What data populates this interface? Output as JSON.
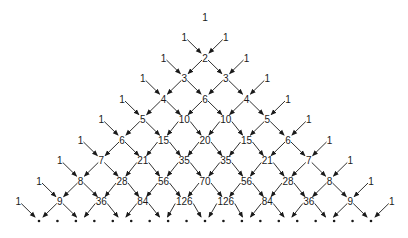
{
  "rows": [
    [
      "1"
    ],
    [
      "1",
      "1"
    ],
    [
      "1",
      "2",
      "1"
    ],
    [
      "1",
      "3",
      "3",
      "1"
    ],
    [
      "1",
      "4",
      "6",
      "4",
      "1"
    ],
    [
      "1",
      "5",
      "10",
      "10",
      "5",
      "1"
    ],
    [
      "1",
      "6",
      "15",
      "20",
      "15",
      "6",
      "1"
    ],
    [
      "1",
      "7",
      "21",
      "35",
      "35",
      "21",
      "7",
      "1"
    ],
    [
      "1",
      "8",
      "28",
      "56",
      "70",
      "56",
      "28",
      "8",
      "1"
    ],
    [
      "1",
      "9",
      "36",
      "84",
      "126",
      "126",
      "84",
      "36",
      "9",
      "1"
    ]
  ],
  "continuation": {
    "symbol": "•",
    "count": 19
  },
  "layout": {
    "apex_x": 205,
    "top_y": 17,
    "row_gap": 20.5,
    "col_gap": 41.5,
    "dot_y": 221
  },
  "colors": {
    "ink": "#1a1a1a",
    "background": "#ffffff"
  }
}
